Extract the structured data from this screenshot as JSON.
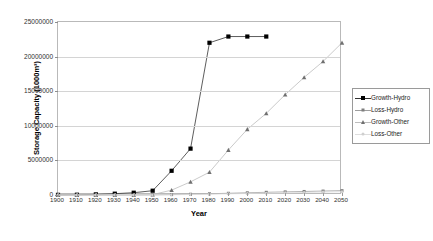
{
  "chart_data": {
    "type": "line",
    "title": "",
    "xlabel": "Year",
    "ylabel": "Storage Capacity (1000m³)",
    "xlim": [
      1900,
      2050
    ],
    "ylim": [
      0,
      25000000
    ],
    "grid": true,
    "legend_position": "right",
    "x_tick_labels": [
      "1900",
      "1910",
      "1920",
      "1930",
      "1940",
      "1950",
      "1960",
      "1970",
      "1980",
      "1990",
      "2000",
      "2010",
      "2020",
      "2030",
      "2040",
      "2050"
    ],
    "y_tick_labels": [
      "0",
      "5000000",
      "10000000",
      "15000000",
      "20000000",
      "25000000"
    ],
    "y_tick_values": [
      0,
      5000000,
      10000000,
      15000000,
      20000000,
      25000000
    ],
    "x": [
      1900,
      1910,
      1920,
      1930,
      1940,
      1950,
      1960,
      1970,
      1980,
      1990,
      2000,
      2010,
      2020,
      2030,
      2040,
      2050
    ],
    "series": [
      {
        "name": "Growth-Hydro",
        "marker": "filled-square",
        "color": "#000000",
        "line_color": "#333333",
        "values": [
          20000,
          40000,
          90000,
          190000,
          330000,
          620000,
          3500000,
          6700000,
          22000000,
          22900000,
          22900000,
          22900000,
          null,
          null,
          null,
          null
        ]
      },
      {
        "name": "Loss-Hydro",
        "marker": "small-square",
        "color": "#7e7e7e",
        "line_color": "#9e9e9e",
        "values": [
          0,
          0,
          2000,
          5000,
          12000,
          25000,
          60000,
          110000,
          180000,
          250000,
          320000,
          390000,
          450000,
          510000,
          570000,
          630000
        ]
      },
      {
        "name": "Growth-Other",
        "marker": "triangle",
        "color": "#6f6f6f",
        "line_color": "#bdbdbd",
        "values": [
          0,
          0,
          0,
          0,
          0,
          60000,
          700000,
          1900000,
          3300000,
          6500000,
          9500000,
          11800000,
          14500000,
          17000000,
          19300000,
          22000000
        ]
      },
      {
        "name": "Loss-Other",
        "marker": "dot",
        "color": "#cfcfcf",
        "line_color": "#dedede",
        "values": [
          0,
          0,
          0,
          0,
          3000,
          10000,
          30000,
          70000,
          120000,
          170000,
          220000,
          270000,
          320000,
          370000,
          420000,
          470000
        ]
      }
    ]
  },
  "legend": {
    "entries": [
      {
        "label": "Growth-Hydro"
      },
      {
        "label": "Loss-Hydro"
      },
      {
        "label": "Growth-Other"
      },
      {
        "label": "Loss-Other"
      }
    ]
  },
  "axes": {
    "x_title": "Year",
    "y_title": "Storage Capacity (1000m³)"
  }
}
